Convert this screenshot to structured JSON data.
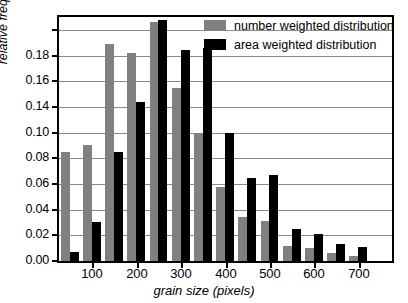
{
  "chart_data": {
    "type": "bar",
    "title": "",
    "xlabel": "grain size (pixels)",
    "ylabel": "relative frequency",
    "xlim": [
      25,
      775
    ],
    "ylim": [
      0.0,
      0.19
    ],
    "grid": true,
    "legend_position": "top-right",
    "bin_width": 50,
    "categories": [
      50,
      100,
      150,
      200,
      250,
      300,
      350,
      400,
      450,
      500,
      550,
      600,
      650,
      700
    ],
    "x_tick_labels": [
      "100",
      "200",
      "300",
      "400",
      "500",
      "600",
      "700"
    ],
    "x_tick_values": [
      100,
      200,
      300,
      400,
      500,
      600,
      700
    ],
    "y_tick_labels": [
      "0.00",
      "0.02",
      "0.04",
      "0.06",
      "0.08",
      "0.10",
      "0.14",
      "0.16",
      "0.18"
    ],
    "y_tick_values": [
      0.0,
      0.02,
      0.04,
      0.06,
      0.08,
      0.1,
      0.12,
      0.14,
      0.16,
      0.18
    ],
    "series": [
      {
        "name": "number weighted distribution",
        "color": "#808080",
        "values": [
          0.085,
          0.09,
          0.169,
          0.162,
          0.186,
          0.135,
          0.1,
          0.058,
          0.034,
          0.031,
          0.012,
          0.01,
          0.006,
          0.004
        ]
      },
      {
        "name": "area weighted distribution",
        "color": "#000000",
        "values": [
          0.007,
          0.03,
          0.085,
          0.124,
          0.188,
          0.164,
          0.166,
          0.1,
          0.065,
          0.067,
          0.025,
          0.021,
          0.013,
          0.011
        ]
      }
    ]
  },
  "legend": {
    "items": [
      {
        "label": "number weighted distribution",
        "color": "#808080"
      },
      {
        "label": "area weighted distribution",
        "color": "#000000"
      }
    ]
  }
}
